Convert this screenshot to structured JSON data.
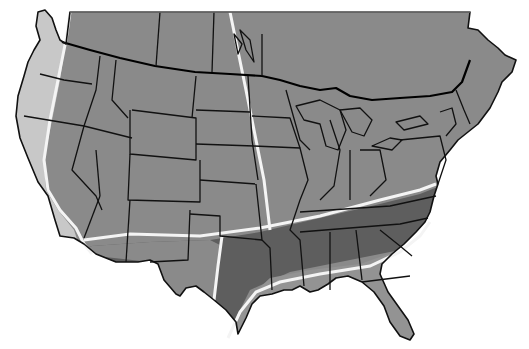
{
  "map": {
    "title": "",
    "region": "Continental United States and southern Canada",
    "colors": {
      "background": "#ffffff",
      "zone_outer_coast": "#c8c8c8",
      "zone_main": "#8a8a8a",
      "zone_south_dark": "#5e5e5e",
      "zone_gulf_light": "#939393",
      "zone_divider": "#f4f4f4",
      "state_border": "#111111",
      "national_border": "#000000"
    },
    "zones": [
      {
        "name": "pacific-coast-zone",
        "shade": "light"
      },
      {
        "name": "interior-zone",
        "shade": "medium"
      },
      {
        "name": "south-central-zone",
        "shade": "dark"
      },
      {
        "name": "gulf-coast-zone",
        "shade": "medium-light"
      }
    ],
    "labels": []
  }
}
